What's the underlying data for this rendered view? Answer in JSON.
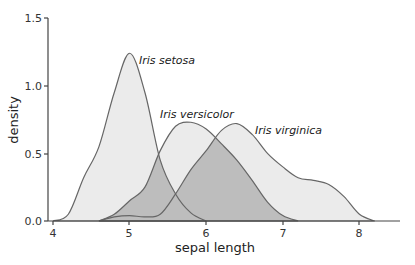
{
  "chart_data": {
    "type": "area",
    "title": "",
    "xlabel": "sepal length",
    "ylabel": "density",
    "xlim": [
      3.9,
      8.6
    ],
    "ylim": [
      0,
      1.5
    ],
    "x_ticks": [
      "4",
      "5",
      "6",
      "7",
      "8"
    ],
    "y_ticks": [
      "0.0",
      "0.5",
      "1.0",
      "1.5"
    ],
    "grid": false,
    "legend": "direct labels",
    "series": [
      {
        "name": "Iris setosa",
        "x": [
          4.0,
          4.2,
          4.4,
          4.6,
          4.8,
          5.0,
          5.2,
          5.4,
          5.6,
          5.8,
          6.0
        ],
        "values": [
          0.0,
          0.05,
          0.32,
          0.55,
          0.95,
          1.24,
          0.95,
          0.45,
          0.2,
          0.06,
          0.0
        ]
      },
      {
        "name": "Iris versicolor",
        "x": [
          4.6,
          4.8,
          5.0,
          5.2,
          5.4,
          5.6,
          5.8,
          6.0,
          6.2,
          6.4,
          6.6,
          6.8,
          7.0,
          7.2
        ],
        "values": [
          0.0,
          0.05,
          0.15,
          0.25,
          0.52,
          0.7,
          0.73,
          0.68,
          0.57,
          0.45,
          0.3,
          0.14,
          0.04,
          0.0
        ]
      },
      {
        "name": "Iris virginica",
        "x": [
          4.6,
          4.8,
          5.0,
          5.2,
          5.4,
          5.6,
          5.8,
          6.0,
          6.2,
          6.4,
          6.6,
          6.8,
          7.0,
          7.2,
          7.4,
          7.6,
          7.8,
          8.0,
          8.2
        ],
        "values": [
          0.0,
          0.03,
          0.04,
          0.03,
          0.05,
          0.2,
          0.38,
          0.52,
          0.67,
          0.72,
          0.64,
          0.5,
          0.4,
          0.32,
          0.3,
          0.27,
          0.18,
          0.05,
          0.0
        ]
      }
    ],
    "annotations": [
      {
        "text": "Iris setosa",
        "x": 5.07,
        "y": 1.2
      },
      {
        "text": "Iris versicolor",
        "x": 5.25,
        "y": 0.78
      },
      {
        "text": "Iris virginica",
        "x": 6.62,
        "y": 0.67
      }
    ]
  },
  "labels": {
    "setosa": "Iris setosa",
    "versicolor": "Iris versicolor",
    "virginica": "Iris virginica",
    "xlabel": "sepal length",
    "ylabel": "density",
    "xt0": "4",
    "xt1": "5",
    "xt2": "6",
    "xt3": "7",
    "xt4": "8",
    "yt0": "0.0",
    "yt1": "0.5",
    "yt2": "1.0",
    "yt3": "1.5"
  },
  "colors": {
    "fill": "#ebebeb",
    "overlap": "#bdbdbd",
    "line": "#666666",
    "axis": "#444444"
  }
}
